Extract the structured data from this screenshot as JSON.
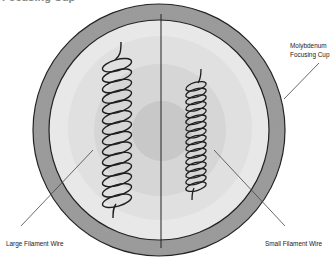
{
  "diagram": {
    "title_fragment": "Focusing Cup",
    "labels": {
      "focusing_cup_line1": "Molybdenum",
      "focusing_cup_line2": "Focusing Cup",
      "large_filament": "Large Filament Wire",
      "small_filament": "Small Filament Wire"
    },
    "colors": {
      "ring": "#9a9a9a",
      "ring_stroke": "#222222",
      "face_outer": "#e6e6e6",
      "face_mid": "#d9d9d9",
      "face_inner": "#cacaca",
      "wire": "#1e1e1e",
      "leader": "#444444"
    },
    "components": [
      {
        "name": "Molybdenum Focusing Cup",
        "shape": "ring"
      },
      {
        "name": "Large Filament Wire",
        "shape": "helix",
        "turns": 14
      },
      {
        "name": "Small Filament Wire",
        "shape": "helix",
        "turns": 16
      }
    ]
  }
}
